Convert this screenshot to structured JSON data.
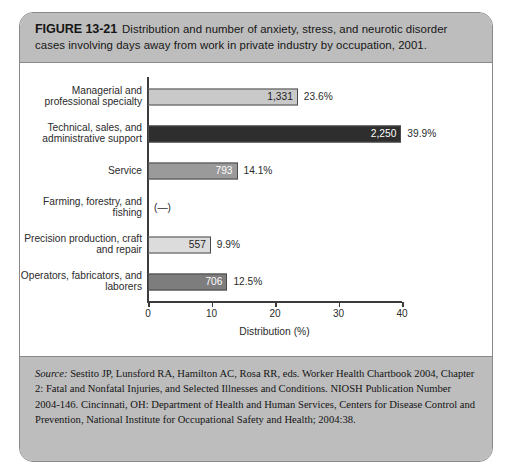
{
  "figure": {
    "number_label": "FIGURE 13-21",
    "caption": "Distribution and number of anxiety, stress, and neurotic disorder cases involving days away from work in private industry by occupation, 2001.",
    "source_label": "Source:",
    "source_text": " Sestito JP, Lunsford RA, Hamilton AC, Rosa RR, eds. Worker Health Chartbook 2004, Chapter 2: Fatal and Nonfatal Injuries, and Selected Illnesses and Conditions. NIOSH Publication Number 2004-146. Cincinnati, OH: Department of Health and Human Services, Centers for Disease Control and Prevention, National Institute for Occupational Safety and Health; 2004:38."
  },
  "chart_data": {
    "type": "bar",
    "orientation": "horizontal",
    "title": "Distribution and number of anxiety, stress, and neurotic disorder cases involving days away from work in private industry by occupation, 2001.",
    "xlabel": "Distribution (%)",
    "ylabel": "",
    "xlim": [
      0,
      40
    ],
    "xticks": [
      0,
      10,
      20,
      30,
      40
    ],
    "xticklabels": [
      "0",
      "10",
      "20",
      "30",
      "40"
    ],
    "grid": false,
    "legend": null,
    "categories": [
      "Managerial and professional specialty",
      "Technical, sales, and administrative support",
      "Service",
      "Farming, forestry, and fishing",
      "Precision production, craft and repair",
      "Operators, fabricators, and laborers"
    ],
    "values": [
      23.6,
      39.9,
      14.1,
      null,
      9.9,
      12.5
    ],
    "counts": [
      "1,331",
      "2,250",
      "793",
      "(—)",
      "557",
      "706"
    ],
    "percent_labels": [
      "23.6%",
      "39.9%",
      "14.1%",
      "",
      "9.9%",
      "12.5%"
    ],
    "bar_colors": [
      "#c9c9c9",
      "#2e2e2e",
      "#9a9a9a",
      "",
      "#dcdcdc",
      "#7d7d7d"
    ],
    "value_text_colors": [
      "#1c1c1c",
      "#ffffff",
      "#ffffff",
      "",
      "#1c1c1c",
      "#ffffff"
    ],
    "no_data_marker": "(—)"
  },
  "style": {
    "header_band": "#bdbdbd",
    "frame_border": "#8a8a8a",
    "axis_color": "#3b3b3b",
    "plot_background": "#ffffff"
  }
}
